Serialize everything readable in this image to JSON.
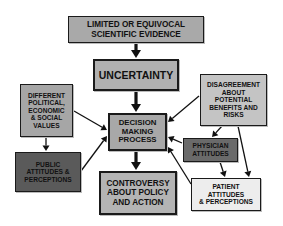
{
  "diagram": {
    "nodes": [
      {
        "id": "evidence",
        "label": "LIMITED OR EQUIVOCAL\nSCIENTIFIC EVIDENCE",
        "x": 68,
        "y": 16,
        "w": 136,
        "h": 27,
        "fill": "#a9a9a9",
        "font": 8.2,
        "thick": false
      },
      {
        "id": "uncertainty",
        "label": "UNCERTAINTY",
        "x": 93,
        "y": 59,
        "w": 86,
        "h": 32,
        "fill": "#b0b0b0",
        "font": 10.5,
        "thick": true
      },
      {
        "id": "values",
        "label": "DIFFERENT\nPOLITICAL,\nECONOMIC\n& SOCIAL\nVALUES",
        "x": 20,
        "y": 84,
        "w": 53,
        "h": 53,
        "fill": "#a6a6a6",
        "font": 6.6,
        "thick": false
      },
      {
        "id": "decision",
        "label": "DECISION\nMAKING\nPROCESS",
        "x": 108,
        "y": 113,
        "w": 59,
        "h": 38,
        "fill": "#a8a8a8",
        "font": 7.8,
        "thick": true
      },
      {
        "id": "disagreement",
        "label": "DISAGREEMENT\nABOUT\nPOTENTIAL\nBENEFITS AND\nRISKS",
        "x": 200,
        "y": 74,
        "w": 67,
        "h": 52,
        "fill": "#c4c4c4",
        "font": 6.6,
        "thick": false
      },
      {
        "id": "public",
        "label": "PUBLIC\nATTITUDES &\nPERCEPTIONS",
        "x": 15,
        "y": 152,
        "w": 66,
        "h": 40,
        "fill": "#5a5a5a",
        "font": 6.6,
        "thick": false
      },
      {
        "id": "physician",
        "label": "PHYSICIAN\nATTITUDES",
        "x": 183,
        "y": 138,
        "w": 55,
        "h": 24,
        "fill": "#6a6a6a",
        "font": 6.6,
        "thick": false
      },
      {
        "id": "controversy",
        "label": "CONTROVERSY\nABOUT POLICY\nAND ACTION",
        "x": 99,
        "y": 171,
        "w": 78,
        "h": 44,
        "fill": "#b4b4b4",
        "font": 8.2,
        "thick": true
      },
      {
        "id": "patient",
        "label": "PATIENT\nATTITUDES\n& PERCEPTIONS",
        "x": 191,
        "y": 178,
        "w": 70,
        "h": 33,
        "fill": "#ededed",
        "font": 6.6,
        "thick": false
      }
    ],
    "arrows": [
      {
        "from": "evidence",
        "to": "uncertainty",
        "x1": 136,
        "y1": 43,
        "x2": 136,
        "y2": 58,
        "width": 3.2,
        "head": 5
      },
      {
        "from": "uncertainty",
        "to": "decision",
        "x1": 136,
        "y1": 91,
        "x2": 136,
        "y2": 112,
        "width": 3.2,
        "head": 5
      },
      {
        "from": "decision",
        "to": "controversy",
        "x1": 136,
        "y1": 151,
        "x2": 136,
        "y2": 170,
        "width": 3.2,
        "head": 5
      },
      {
        "from": "values",
        "to": "decision",
        "x1": 74,
        "y1": 111,
        "x2": 107,
        "y2": 130,
        "width": 1.3,
        "head": 3.5
      },
      {
        "from": "values",
        "to": "public",
        "x1": 46,
        "y1": 137,
        "x2": 46,
        "y2": 151,
        "width": 1.3,
        "head": 3.5
      },
      {
        "from": "public",
        "to": "decision",
        "x1": 81,
        "y1": 171,
        "x2": 107,
        "y2": 136,
        "width": 1.3,
        "head": 3.5
      },
      {
        "from": "disagreement",
        "to": "decision",
        "x1": 199,
        "y1": 96,
        "x2": 168,
        "y2": 122,
        "width": 1.3,
        "head": 3.5
      },
      {
        "from": "disagreement",
        "to": "physician",
        "x1": 222,
        "y1": 126,
        "x2": 212,
        "y2": 137,
        "width": 1.3,
        "head": 3.5
      },
      {
        "from": "disagreement",
        "to": "patient",
        "x1": 238,
        "y1": 126,
        "x2": 249,
        "y2": 177,
        "width": 1.3,
        "head": 3.5
      },
      {
        "from": "physician",
        "to": "decision",
        "x1": 182,
        "y1": 143,
        "x2": 168,
        "y2": 137,
        "width": 1.3,
        "head": 3.5
      },
      {
        "from": "physician",
        "to": "patient",
        "x1": 220,
        "y1": 162,
        "x2": 225,
        "y2": 177,
        "width": 1.3,
        "head": 3.5
      },
      {
        "from": "patient",
        "to": "decision",
        "x1": 191,
        "y1": 184,
        "x2": 168,
        "y2": 147,
        "width": 1.3,
        "head": 3.5
      }
    ],
    "colors": {
      "border": "#1a1a1a",
      "arrow": "#111111",
      "text": "#111111",
      "background": "#ffffff"
    }
  }
}
